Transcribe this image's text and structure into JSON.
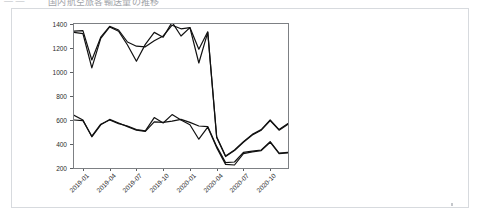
{
  "header": {
    "leading_marks": "—   —",
    "title_fragment": "国内航空旅客輸送量の推移"
  },
  "figure": {
    "title": "",
    "dot_marker": "stray-dot"
  },
  "chart_data": {
    "type": "line",
    "title": "",
    "xlabel": "",
    "ylabel": "",
    "ylim": [
      200,
      1400
    ],
    "yticks": [
      200,
      400,
      600,
      800,
      1000,
      1200,
      1400
    ],
    "ytick_labels": [
      "200",
      "400",
      "600",
      "800",
      "1000",
      "1200",
      "1400"
    ],
    "grid": false,
    "legend_position": "none",
    "x": [
      "2018-12",
      "2019-01",
      "2019-02",
      "2019-03",
      "2019-04",
      "2019-05",
      "2019-06",
      "2019-07",
      "2019-08",
      "2019-09",
      "2019-10",
      "2019-11",
      "2019-12",
      "2020-01",
      "2020-02",
      "2020-03",
      "2020-04",
      "2020-05",
      "2020-06",
      "2020-07",
      "2020-08",
      "2020-09",
      "2020-10",
      "2020-11",
      "2020-12"
    ],
    "xtick_positions": [
      "2019-01",
      "2019-04",
      "2019-07",
      "2019-10",
      "2020-01",
      "2020-04",
      "2020-07",
      "2020-10"
    ],
    "xtick_labels": [
      "2019-01",
      "2019-04",
      "2019-07",
      "2019-10",
      "2020-01",
      "2020-04",
      "2020-07",
      "2020-10"
    ],
    "series": [
      {
        "name": "upper-series-a",
        "color": "#111111",
        "values": [
          1340,
          1345,
          1100,
          1290,
          1380,
          1350,
          1250,
          1215,
          1210,
          1260,
          1300,
          1390,
          1360,
          1370,
          1190,
          1335,
          460,
          300,
          350,
          420,
          480,
          520,
          600,
          520,
          570
        ]
      },
      {
        "name": "upper-series-b",
        "color": "#111111",
        "values": [
          1330,
          1320,
          1035,
          1280,
          1375,
          1340,
          1225,
          1090,
          1230,
          1330,
          1290,
          1415,
          1300,
          1370,
          1075,
          1330,
          455,
          295,
          345,
          415,
          475,
          515,
          595,
          515,
          565
        ]
      },
      {
        "name": "lower-series-a",
        "color": "#111111",
        "values": [
          640,
          600,
          460,
          560,
          605,
          575,
          545,
          515,
          505,
          585,
          580,
          590,
          605,
          580,
          550,
          545,
          380,
          245,
          250,
          330,
          340,
          350,
          420,
          325,
          330
        ]
      },
      {
        "name": "lower-series-b",
        "color": "#111111",
        "values": [
          600,
          595,
          465,
          565,
          600,
          570,
          550,
          520,
          510,
          620,
          575,
          645,
          600,
          560,
          440,
          540,
          370,
          230,
          225,
          320,
          335,
          345,
          415,
          320,
          325
        ]
      }
    ]
  }
}
